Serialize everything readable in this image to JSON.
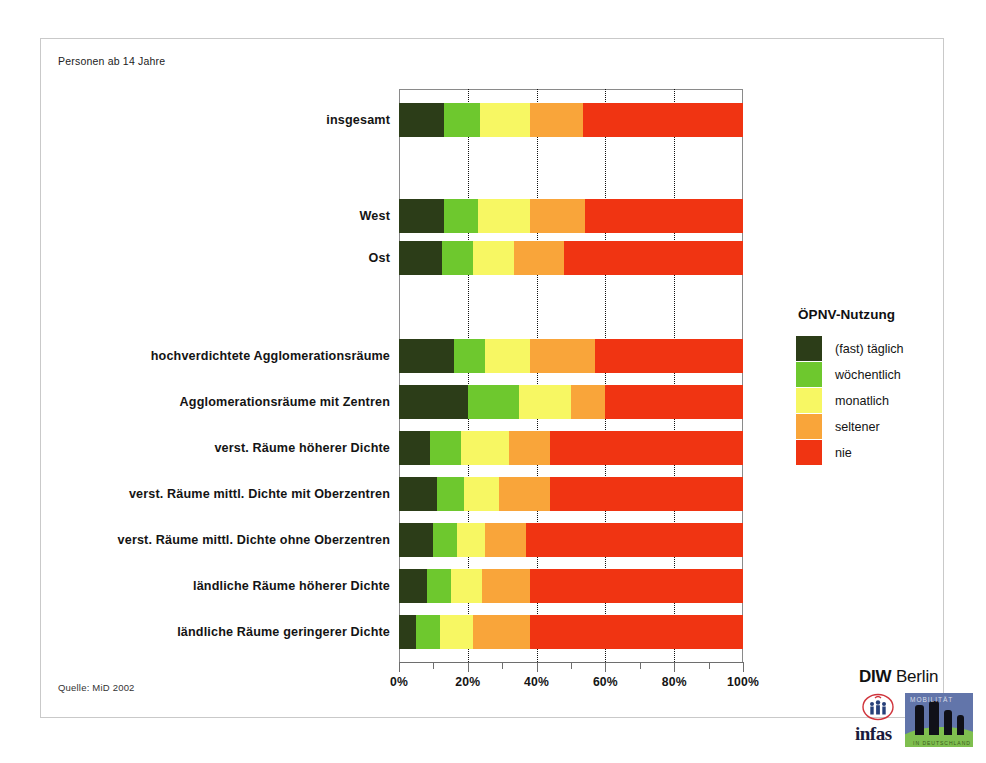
{
  "figure": {
    "subject_note": "Personen ab 14 Jahre",
    "source_note": "Quelle: MiD 2002"
  },
  "legend": {
    "title": "ÖPNV-Nutzung",
    "items": [
      {
        "label": "(fast) täglich",
        "color": "#2c3d18"
      },
      {
        "label": "wöchentlich",
        "color": "#6ec82e"
      },
      {
        "label": "monatlich",
        "color": "#f7f763"
      },
      {
        "label": "seltener",
        "color": "#f9a53a"
      },
      {
        "label": "nie",
        "color": "#f03412"
      }
    ]
  },
  "logo": {
    "diw_bold": "DIW",
    "diw_light": " Berlin",
    "infas": "infas",
    "tile_top_word": "MOBILITÄT",
    "tile_bottom_word": "IN DEUTSCHLAND"
  },
  "chart_data": {
    "type": "bar",
    "orientation": "horizontal",
    "stacked": true,
    "normalized_percent": true,
    "title": "",
    "subtitle": "Personen ab 14 Jahre",
    "xlabel": "",
    "ylabel": "",
    "xlim": [
      0,
      100
    ],
    "xticks": [
      0,
      10,
      20,
      30,
      40,
      50,
      60,
      70,
      80,
      90,
      100
    ],
    "xticklabels": [
      "0%",
      "",
      "20%",
      "",
      "40%",
      "",
      "60%",
      "",
      "80%",
      "",
      "100%"
    ],
    "grid": "vertical-dotted-at-20-40-60-80",
    "legend_position": "right",
    "categories": [
      "insgesamt",
      "West",
      "Ost",
      "hochverdichtete Agglomerationsräume",
      "Agglomerationsräume mit  Zentren",
      "verst. Räume höherer Dichte",
      "verst. Räume mittl. Dichte mit Oberzentren",
      "verst. Räume mittl. Dichte ohne Oberzentren",
      "ländliche Räume höherer Dichte",
      "ländliche Räume geringerer Dichte"
    ],
    "series": [
      {
        "name": "(fast) täglich",
        "color": "#2c3d18",
        "values": [
          13,
          13,
          12.5,
          16,
          20,
          9,
          11,
          10,
          8,
          5
        ]
      },
      {
        "name": "wöchentlich",
        "color": "#6ec82e",
        "values": [
          10.5,
          10,
          9,
          9,
          15,
          9,
          8,
          7,
          7,
          7
        ]
      },
      {
        "name": "monatlich",
        "color": "#f7f763",
        "values": [
          14.5,
          15,
          12,
          13,
          15,
          14,
          10,
          8,
          9,
          9.5
        ]
      },
      {
        "name": "seltener",
        "color": "#f9a53a",
        "values": [
          15.5,
          16,
          14.5,
          19,
          10,
          12,
          15,
          12,
          14,
          16.5
        ]
      },
      {
        "name": "nie",
        "color": "#f03412",
        "values": [
          46.5,
          46,
          52,
          43,
          40,
          56,
          56,
          63,
          62,
          62
        ]
      }
    ]
  }
}
